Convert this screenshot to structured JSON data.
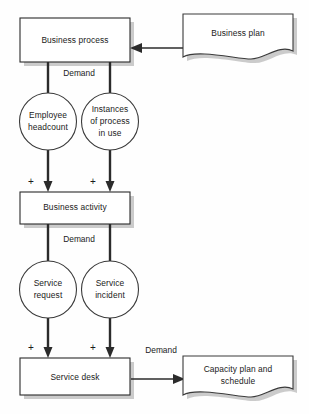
{
  "diagram": {
    "type": "flowchart",
    "canvas": {
      "width": 309,
      "height": 414
    },
    "colors": {
      "background": "#fefefe",
      "stroke": "#2b2b2b",
      "shadow": "#b9b9b9",
      "text": "#1a1a1a",
      "fill": "#ffffff"
    },
    "nodes": {
      "business_process": {
        "label": "Business process",
        "shape": "rectangle"
      },
      "business_plan": {
        "label": "Business plan",
        "shape": "document"
      },
      "employee_headcount": {
        "label_line1": "Employee",
        "label_line2": "headcount",
        "shape": "circle"
      },
      "instances_of_process": {
        "label_line1": "Instances",
        "label_line2": "of process",
        "label_line3": "in use",
        "shape": "circle"
      },
      "business_activity": {
        "label": "Business activity",
        "shape": "rectangle"
      },
      "service_request": {
        "label_line1": "Service",
        "label_line2": "request",
        "shape": "circle"
      },
      "service_incident": {
        "label_line1": "Service",
        "label_line2": "incident",
        "shape": "circle"
      },
      "service_desk": {
        "label": "Service desk",
        "shape": "rectangle"
      },
      "capacity_plan": {
        "label_line1": "Capacity plan and",
        "label_line2": "schedule",
        "shape": "document"
      }
    },
    "edge_labels": {
      "demand_top": "Demand",
      "demand_middle": "Demand",
      "demand_bottom": "Demand"
    },
    "operators": {
      "plus_1": "+",
      "plus_2": "+",
      "plus_3": "+",
      "plus_4": "+"
    }
  }
}
